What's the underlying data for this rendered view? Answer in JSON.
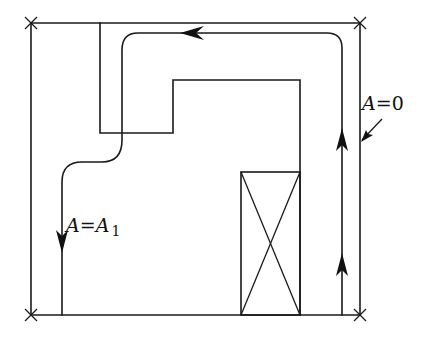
{
  "diagram": {
    "type": "flux-line / boundary-condition schematic",
    "boundary": {
      "corners": [
        [
          31,
          23
        ],
        [
          360,
          23
        ],
        [
          31,
          315
        ],
        [
          360,
          315
        ]
      ],
      "corner_marker": "x-mark"
    },
    "labels": {
      "outer_boundary": {
        "var": "A",
        "eq": "=",
        "value": "0"
      },
      "inner_line": {
        "var": "A",
        "eq": "=",
        "value": "A",
        "subscript": "1"
      }
    },
    "flux_line": {
      "direction": "up on right, left along top, down on left",
      "arrow_count": 4
    },
    "inner_region": {
      "outline": "stepped L-shape"
    },
    "block": {
      "style": "rectangle with cross (X)"
    },
    "colors": {
      "stroke": "#1a1a1a",
      "background": "#ffffff"
    }
  }
}
